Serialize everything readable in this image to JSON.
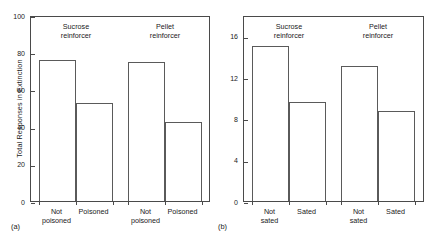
{
  "figure": {
    "panels": [
      {
        "letter": "(a)",
        "ylabel": "Total Responses in Extinction",
        "yticks": [
          "0",
          "20",
          "40",
          "60",
          "80",
          "100"
        ],
        "groups": [
          {
            "header_line1": "Sucrose",
            "header_line2": "reinforcer"
          },
          {
            "header_line1": "Pellet",
            "header_line2": "reinforcer"
          }
        ],
        "xlabels": [
          {
            "line1": "Not",
            "line2": "poisoned"
          },
          {
            "line1": "Poisoned",
            "line2": ""
          },
          {
            "line1": "Not",
            "line2": "poisoned"
          },
          {
            "line1": "Poisoned",
            "line2": ""
          }
        ]
      },
      {
        "letter": "(b)",
        "ylabel": "",
        "yticks": [
          "0",
          "4",
          "8",
          "12",
          "16"
        ],
        "groups": [
          {
            "header_line1": "Sucrose",
            "header_line2": "reinforcer"
          },
          {
            "header_line1": "Pellet",
            "header_line2": "reinforcer"
          }
        ],
        "xlabels": [
          {
            "line1": "Not",
            "line2": "sated"
          },
          {
            "line1": "Sated",
            "line2": ""
          },
          {
            "line1": "Not",
            "line2": "sated"
          },
          {
            "line1": "Sated",
            "line2": ""
          }
        ]
      }
    ],
    "colors": {
      "bar_outline": "#5a5a5a",
      "axis": "#4a4a4a",
      "text": "#1a1a1a",
      "background": "#ffffff"
    }
  },
  "chart_data": [
    {
      "type": "bar",
      "panel": "(a)",
      "title": "",
      "xlabel": "",
      "ylabel": "Total Responses in Extinction",
      "ylim": [
        0,
        100
      ],
      "yticks": [
        0,
        20,
        40,
        60,
        80,
        100
      ],
      "grid": false,
      "legend": "none",
      "groups": [
        "Sucrose reinforcer",
        "Pellet reinforcer"
      ],
      "categories": [
        "Not poisoned",
        "Poisoned",
        "Not poisoned",
        "Poisoned"
      ],
      "values": [
        76,
        52.5,
        75,
        42.5
      ]
    },
    {
      "type": "bar",
      "panel": "(b)",
      "title": "",
      "xlabel": "",
      "ylabel": "",
      "ylim": [
        0,
        18
      ],
      "yticks": [
        0,
        4,
        8,
        12,
        16
      ],
      "grid": false,
      "legend": "none",
      "groups": [
        "Sucrose reinforcer",
        "Pellet reinforcer"
      ],
      "categories": [
        "Not sated",
        "Sated",
        "Not sated",
        "Sated"
      ],
      "values": [
        15.0,
        9.6,
        13.1,
        8.7
      ]
    }
  ]
}
